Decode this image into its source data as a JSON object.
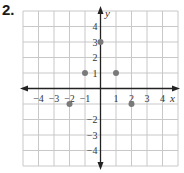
{
  "problem_number": "2.",
  "graph": {
    "x_axis_label": "x",
    "y_axis_label": "y",
    "x_range": [
      -5,
      5
    ],
    "y_range": [
      -5,
      5
    ],
    "x_tick_labels": [
      "−4",
      "−3",
      "−2",
      "−1",
      "1",
      "2",
      "3",
      "4"
    ],
    "x_tick_values": [
      -4,
      -3,
      -2,
      -1,
      1,
      2,
      3,
      4
    ],
    "y_tick_labels": [
      "4",
      "3",
      "2",
      "1",
      "−2",
      "−3",
      "−4"
    ],
    "y_tick_values": [
      4,
      3,
      2,
      1,
      -2,
      -3,
      -4
    ],
    "points": [
      {
        "x": 0,
        "y": 3
      },
      {
        "x": -1,
        "y": 1
      },
      {
        "x": 1,
        "y": 1
      },
      {
        "x": -2,
        "y": -1
      },
      {
        "x": 2,
        "y": -1
      }
    ],
    "colors": {
      "grid": "#c8c8c8",
      "axis": "#222222",
      "point": "#7a7a7a"
    }
  }
}
